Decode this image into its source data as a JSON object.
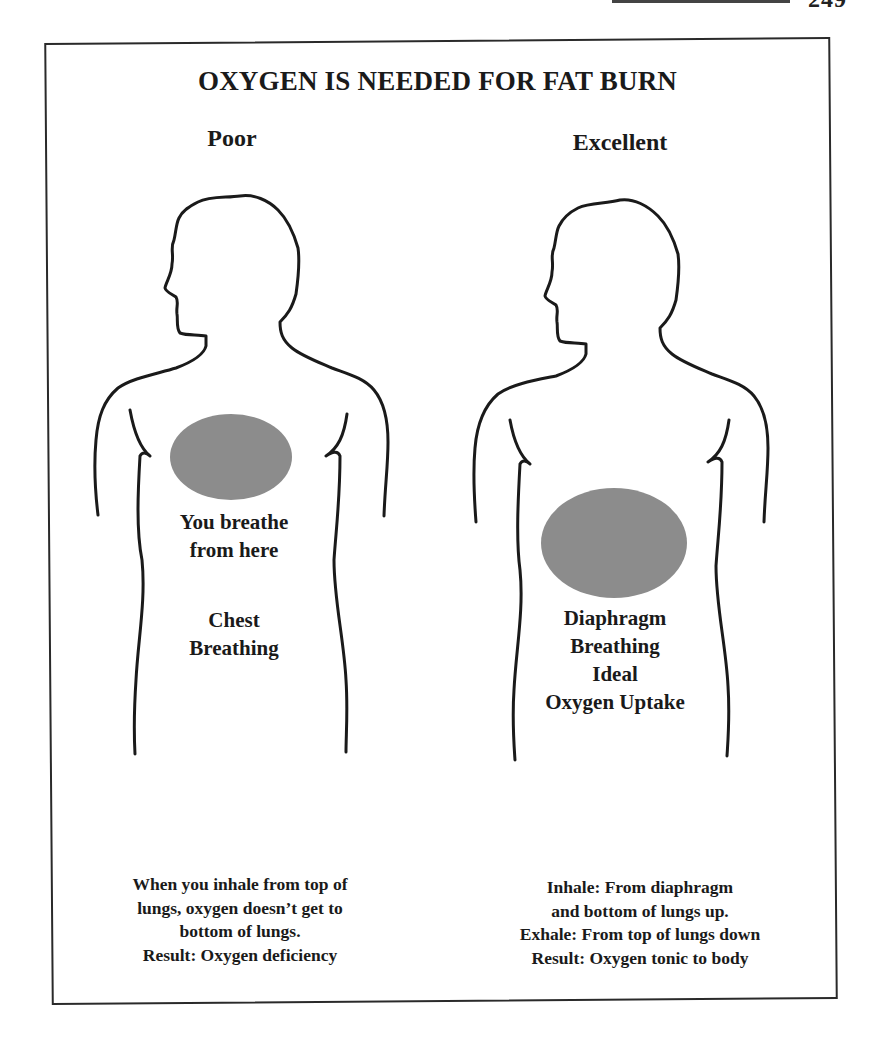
{
  "page": {
    "page_number": "249"
  },
  "figure": {
    "title": "OXYGEN IS NEEDED FOR FAT BURN",
    "fill_color": "#8c8c8c",
    "outline_color": "#1a1a1a",
    "left": {
      "label": "Poor",
      "caption_lines": [
        "You breathe",
        "from here"
      ],
      "type_lines": [
        "Chest",
        "Breathing"
      ],
      "note_lines": [
        "When you inhale from top of",
        "lungs, oxygen doesn’t get to",
        "bottom of lungs.",
        "Result: Oxygen deficiency"
      ]
    },
    "right": {
      "label": "Excellent",
      "caption_lines": [
        "Diaphragm",
        "Breathing",
        "Ideal",
        "Oxygen Uptake"
      ],
      "note_lines": [
        "Inhale: From diaphragm",
        "and bottom of lungs up.",
        "Exhale: From top of lungs down",
        "Result: Oxygen tonic to body"
      ]
    }
  }
}
